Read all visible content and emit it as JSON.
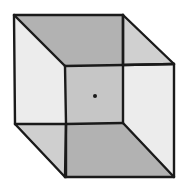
{
  "diagram": {
    "title": "Necker cube",
    "colors": {
      "background": "#ffffff",
      "stroke": "#1a1a1a",
      "top_face": "#b2b2b2",
      "top_right_wedge": "#d0d0d0",
      "left_face": "#ececec",
      "right_face": "#ececec",
      "center_square": "#c6c6c6",
      "bottom_face": "#b2b2b2",
      "bottom_left_wedge": "#cfcfcf",
      "dot": "#1a1a1a"
    },
    "vertices": {
      "outer_top_left": [
        14,
        15
      ],
      "outer_top_right": [
        123,
        15
      ],
      "outer_right_top": [
        174,
        64
      ],
      "outer_right_bottom": [
        174,
        177
      ],
      "outer_bottom_left": [
        65,
        177
      ],
      "outer_left_bottom": [
        15,
        124
      ],
      "inner_top_left": [
        65,
        66
      ],
      "inner_top_right": [
        123,
        65
      ],
      "inner_bottom_right": [
        123,
        123
      ],
      "inner_bottom_left": [
        66,
        124
      ]
    },
    "fixation_dot": {
      "cx": 95,
      "cy": 96,
      "r": 2
    }
  }
}
